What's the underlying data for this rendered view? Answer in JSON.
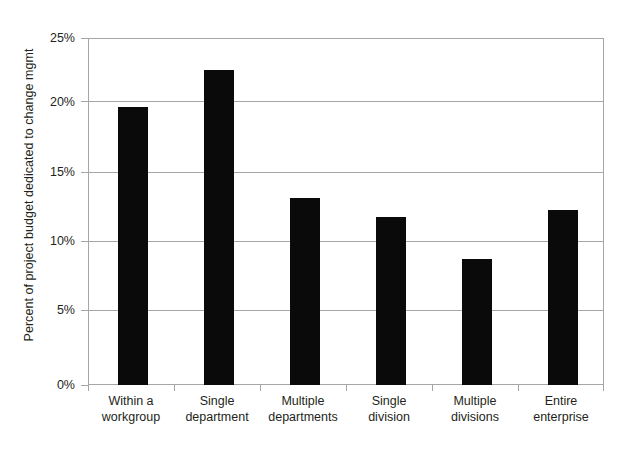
{
  "chart_data": {
    "type": "bar",
    "title": "",
    "xlabel": "",
    "ylabel": "Percent of project budget dedicated to change mgmt",
    "categories": [
      "Within a workgroup",
      "Single department",
      "Multiple departments",
      "Single division",
      "Multiple divisions",
      "Entire enterprise"
    ],
    "category_lines": [
      [
        "Within a",
        "workgroup"
      ],
      [
        "Single",
        "department"
      ],
      [
        "Multiple",
        "departments"
      ],
      [
        "Single",
        "division"
      ],
      [
        "Multiple",
        "divisions"
      ],
      [
        "Entire",
        "enterprise"
      ]
    ],
    "values": [
      20.0,
      22.7,
      13.5,
      12.1,
      9.1,
      12.6
    ],
    "value_unit": "%",
    "ylim": [
      0,
      25
    ],
    "ytick_values": [
      0,
      5,
      10,
      15,
      20,
      25
    ],
    "ytick_labels": [
      "0%",
      "5%",
      "10%",
      "15%",
      "20%",
      "25%"
    ],
    "grid": true,
    "legend": false,
    "bar_color": "#0a0a0a",
    "axis_color": "#a6a6a6",
    "background": "#ffffff"
  }
}
